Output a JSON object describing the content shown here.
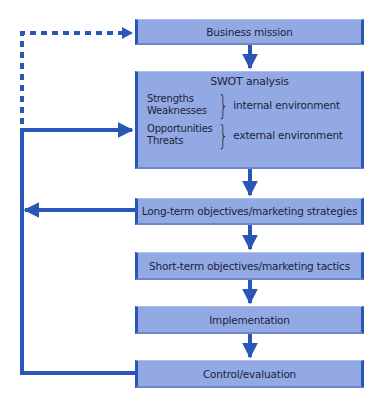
{
  "diagram": {
    "nodes": [
      {
        "id": "business-mission",
        "label": "Business mission"
      },
      {
        "id": "swot-analysis",
        "label": "SWOT analysis",
        "groups": [
          {
            "items": [
              "Strengths",
              "Weaknesses"
            ],
            "label": "internal environment"
          },
          {
            "items": [
              "Opportunities",
              "Threats"
            ],
            "label": "external environment"
          }
        ]
      },
      {
        "id": "long-term",
        "label": "Long-term objectives/marketing strategies"
      },
      {
        "id": "short-term",
        "label": "Short-term objectives/marketing tactics"
      },
      {
        "id": "implementation",
        "label": "Implementation"
      },
      {
        "id": "control",
        "label": "Control/evaluation"
      }
    ],
    "edges": [
      {
        "from": "business-mission",
        "to": "swot-analysis",
        "style": "solid"
      },
      {
        "from": "swot-analysis",
        "to": "long-term",
        "style": "solid"
      },
      {
        "from": "long-term",
        "to": "short-term",
        "style": "solid"
      },
      {
        "from": "short-term",
        "to": "implementation",
        "style": "solid"
      },
      {
        "from": "implementation",
        "to": "control",
        "style": "solid"
      },
      {
        "from": "control",
        "to": "swot-analysis",
        "style": "solid",
        "type": "feedback"
      },
      {
        "from": "control",
        "to": "long-term",
        "style": "solid",
        "type": "feedback"
      },
      {
        "from": "control",
        "to": "business-mission",
        "style": "dashed",
        "type": "feedback"
      }
    ]
  },
  "colors": {
    "box_fill": "#93a9e3",
    "box_border": "#2a56b8",
    "arrow": "#2a56b8",
    "text": "#1c2340"
  }
}
